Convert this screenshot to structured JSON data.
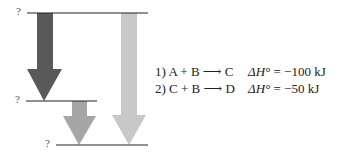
{
  "diagram": {
    "type": "enthalpy level diagram",
    "levels": [
      {
        "id": "top",
        "label": "?"
      },
      {
        "id": "middle",
        "label": "?"
      },
      {
        "id": "bottom",
        "label": "?"
      }
    ],
    "arrows": [
      {
        "id": "reaction-1",
        "from": "top",
        "to": "middle",
        "color": "#595959"
      },
      {
        "id": "reaction-2",
        "from": "middle",
        "to": "bottom",
        "color": "#a6a6a6"
      },
      {
        "id": "overall",
        "from": "top",
        "to": "bottom",
        "color": "#c8c8c8"
      }
    ]
  },
  "reactions": [
    {
      "number": "1)",
      "equation": "A + B ⟶ C",
      "dh_symbol": "ΔH°",
      "value": "= −100 kJ"
    },
    {
      "number": "2)",
      "equation": "C + B ⟶ D",
      "dh_symbol": "ΔH°",
      "value": "= −50 kJ"
    }
  ]
}
